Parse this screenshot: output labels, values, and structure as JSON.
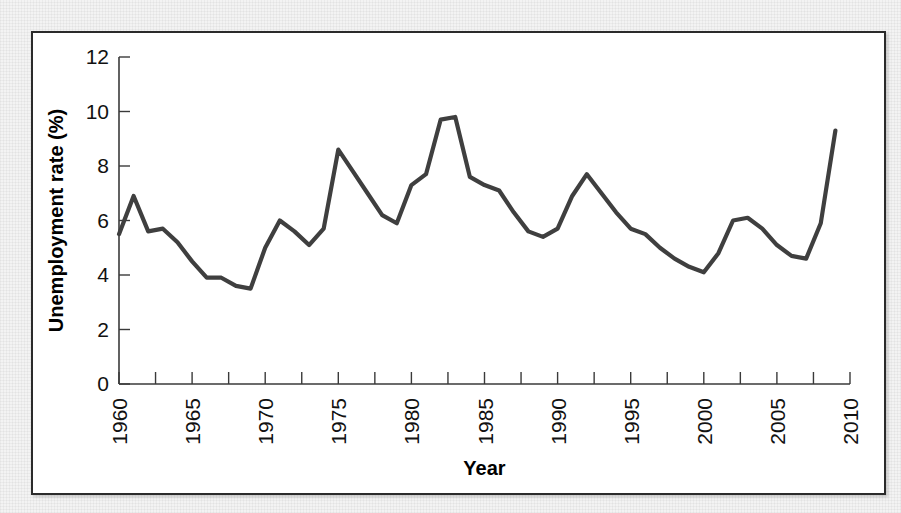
{
  "figure": {
    "background_color": "#f3f3f3",
    "panel_color": "#ffffff",
    "frame_color": "#2b2b2b",
    "line_color": "#3f3f3f"
  },
  "chart_data": {
    "type": "line",
    "title": "",
    "xlabel": "Year",
    "ylabel": "Unemployment rate (%)",
    "xlim": [
      1960,
      2010
    ],
    "ylim": [
      0,
      12
    ],
    "grid": false,
    "legend": null,
    "x_tick_labels": [
      "1960",
      "1965",
      "1970",
      "1975",
      "1980",
      "1985",
      "1990",
      "1995",
      "2000",
      "2005",
      "2010"
    ],
    "x_tick_values": [
      1960,
      1965,
      1970,
      1975,
      1980,
      1985,
      1990,
      1995,
      2000,
      2005,
      2010
    ],
    "x_minor_tick_interval": 2.5,
    "y_tick_labels": [
      "0",
      "2",
      "4",
      "6",
      "8",
      "10",
      "12"
    ],
    "y_tick_values": [
      0,
      2,
      4,
      6,
      8,
      10,
      12
    ],
    "x_tick_label_rotation": -90,
    "series": [
      {
        "name": "Unemployment rate",
        "color": "#3f3f3f",
        "x": [
          1960,
          1961,
          1962,
          1963,
          1964,
          1965,
          1966,
          1967,
          1968,
          1969,
          1970,
          1971,
          1972,
          1973,
          1974,
          1975,
          1976,
          1977,
          1978,
          1979,
          1980,
          1981,
          1982,
          1983,
          1984,
          1985,
          1986,
          1987,
          1988,
          1989,
          1990,
          1991,
          1992,
          1993,
          1994,
          1995,
          1996,
          1997,
          1998,
          1999,
          2000,
          2001,
          2002,
          2003,
          2004,
          2005,
          2006,
          2007,
          2008,
          2009
        ],
        "values": [
          5.5,
          6.9,
          5.6,
          5.7,
          5.2,
          4.5,
          3.9,
          3.9,
          3.6,
          3.5,
          5.0,
          6.0,
          5.6,
          5.1,
          5.7,
          8.6,
          7.8,
          7.0,
          6.2,
          5.9,
          7.3,
          7.7,
          9.7,
          9.8,
          7.6,
          7.3,
          7.1,
          6.3,
          5.6,
          5.4,
          5.7,
          6.9,
          7.7,
          7.0,
          6.3,
          5.7,
          5.5,
          5.0,
          4.6,
          4.3,
          4.1,
          4.8,
          6.0,
          6.1,
          5.7,
          5.1,
          4.7,
          4.6,
          5.9,
          9.3
        ]
      }
    ]
  }
}
